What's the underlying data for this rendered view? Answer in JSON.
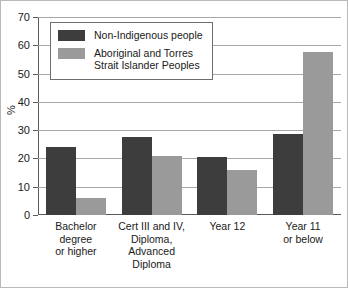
{
  "chart_data": {
    "type": "bar",
    "title": "",
    "xlabel": "",
    "ylabel": "%",
    "ylim": [
      0,
      70
    ],
    "ytick_step": 10,
    "grid": true,
    "legend_position": "top-left inside plot",
    "categories": [
      "Bachelor\ndegree\nor higher",
      "Cert III and IV,\nDiploma,\nAdvanced\nDiploma",
      "Year 12",
      "Year 11\nor below"
    ],
    "ytick_labels": [
      "70",
      "60",
      "50",
      "40",
      "30",
      "20",
      "10",
      "0"
    ],
    "ytick_values": [
      70,
      60,
      50,
      40,
      30,
      20,
      10,
      0
    ],
    "series": [
      {
        "name": "Non-Indigenous people",
        "color": "#3d3d3d",
        "values": [
          24.2,
          27.6,
          20.6,
          28.7
        ]
      },
      {
        "name": "Aboriginal and Torres\nStrait Islander Peoples",
        "color": "#9a9a9a",
        "values": [
          5.9,
          20.7,
          16.0,
          57.6
        ]
      }
    ]
  },
  "legend": {
    "items": [
      {
        "label": "Non-Indigenous people",
        "swatch": "dark"
      },
      {
        "label": "Aboriginal and Torres\nStrait Islander Peoples",
        "swatch": "light"
      }
    ]
  },
  "axis": {
    "y_title": "%"
  }
}
